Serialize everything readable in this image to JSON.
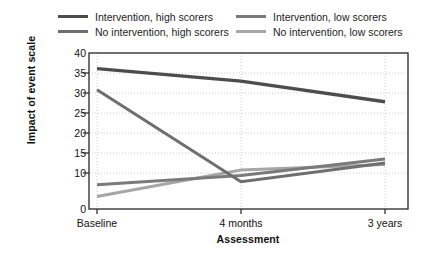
{
  "chart_data": {
    "type": "line",
    "title": "",
    "xlabel": "Assessment",
    "ylabel": "Impact of event scale",
    "categories": [
      "Baseline",
      "4 months",
      "3 years"
    ],
    "ylim": [
      0,
      40
    ],
    "yticks": [
      0,
      10,
      15,
      20,
      25,
      30,
      35,
      40
    ],
    "grid": true,
    "legend_position": "top",
    "series": [
      {
        "name": "Intervention, high scorers",
        "color": "#4d4d4d",
        "values": [
          36.0,
          32.8,
          27.5
        ]
      },
      {
        "name": "Intervention, low scorers",
        "color": "#7a7a7a",
        "values": [
          6.2,
          8.6,
          12.8
        ]
      },
      {
        "name": "No intervention, high scorers",
        "color": "#6e6e6e",
        "values": [
          30.6,
          7.0,
          11.8
        ]
      },
      {
        "name": "No intervention, low scorers",
        "color": "#a6a6a6",
        "values": [
          3.2,
          10.0,
          11.4
        ]
      }
    ]
  },
  "legend": {
    "items": [
      {
        "label": "Intervention, high scorers",
        "color": "#4d4d4d"
      },
      {
        "label": "Intervention, low scorers",
        "color": "#7a7a7a"
      },
      {
        "label": "No intervention, high scorers",
        "color": "#6e6e6e"
      },
      {
        "label": "No intervention, low scorers",
        "color": "#a6a6a6"
      }
    ]
  },
  "axes": {
    "y_title": "Impact of event scale",
    "x_title": "Assessment",
    "y_ticks": [
      "40",
      "35",
      "30",
      "25",
      "20",
      "15",
      "10",
      "0"
    ],
    "x_ticks": [
      "Baseline",
      "4 months",
      "3 years"
    ]
  }
}
